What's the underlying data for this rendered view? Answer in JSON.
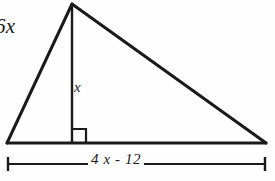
{
  "figure": {
    "kind": "geometry-diagram",
    "shape": "triangle-with-altitude",
    "background_color": "#fefefe",
    "stroke_color": "#1a1a1a",
    "labels": {
      "left_side": "6x",
      "altitude": "x",
      "base": "4 x - 12"
    },
    "markers": {
      "right_angle": "right-angle-square",
      "dimension_line": "base-dimension-line"
    },
    "geometry": {
      "apex": [
        72,
        4
      ],
      "left_vertex": [
        7,
        143
      ],
      "right_vertex": [
        266,
        143
      ],
      "altitude_foot": [
        72,
        143
      ],
      "right_angle_size": 14,
      "dimension_line_y": 164,
      "dimension_line_x_start": 7,
      "dimension_line_x_end": 266,
      "dimension_tick_half_height": 6
    }
  }
}
